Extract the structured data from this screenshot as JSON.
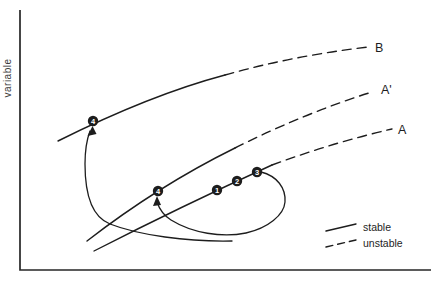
{
  "diagram": {
    "y_axis_label": "variable",
    "curves": [
      {
        "id": "B",
        "label": "B",
        "stable_segment": "solid",
        "unstable_segment": "dashed"
      },
      {
        "id": "A'",
        "label": "A'",
        "stable_segment": "solid",
        "unstable_segment": "dashed"
      },
      {
        "id": "A",
        "label": "A",
        "stable_segment": "solid",
        "unstable_segment": "dashed"
      }
    ],
    "points": [
      {
        "label": "1",
        "curve": "A",
        "x": 217,
        "y": 190
      },
      {
        "label": "2",
        "curve": "A",
        "x": 237,
        "y": 181
      },
      {
        "label": "3",
        "curve": "A",
        "x": 257,
        "y": 172
      },
      {
        "label": "4",
        "curve": "A'",
        "x": 158,
        "y": 191
      },
      {
        "label": "4",
        "curve": "B",
        "x": 93,
        "y": 121
      }
    ],
    "legend": {
      "stable_label": "stable",
      "unstable_label": "unstable"
    },
    "colors": {
      "line": "#1d1d1d",
      "background": "#ffffff"
    }
  }
}
